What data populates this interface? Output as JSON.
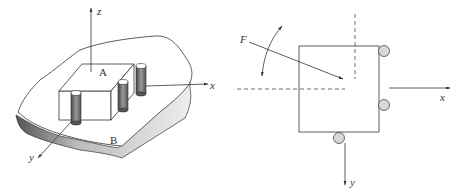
{
  "figure_left": {
    "title": "Fixture block on base plate (3D view)",
    "labels": {
      "z_axis": "z",
      "x_axis": "x",
      "y_axis": "y",
      "point_a": "A",
      "point_b": "B"
    },
    "pin_count": 3
  },
  "figure_right": {
    "title": "Plan view with locating pins and applied force",
    "labels": {
      "force": "F",
      "x_axis": "x",
      "y_axis": "y"
    },
    "locator_count": 3
  },
  "colors": {
    "line": "#333333",
    "pin_fill": "#d8d8d8",
    "shadow": "#8a8a8a"
  }
}
